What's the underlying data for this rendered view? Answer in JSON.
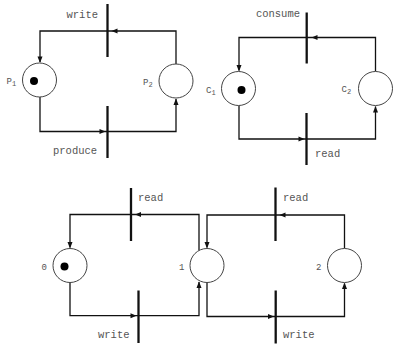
{
  "diagram": {
    "top_left_net": {
      "places": [
        {
          "label": "P",
          "subscript": "1",
          "tokens": 1
        },
        {
          "label": "P",
          "subscript": "2",
          "tokens": 0
        }
      ],
      "transitions": [
        {
          "label": "write",
          "position": "top"
        },
        {
          "label": "produce",
          "position": "bottom"
        }
      ],
      "arcs": [
        {
          "from": "P2",
          "to": "write"
        },
        {
          "from": "write",
          "to": "P1"
        },
        {
          "from": "P1",
          "to": "produce"
        },
        {
          "from": "produce",
          "to": "P2"
        }
      ]
    },
    "top_right_net": {
      "places": [
        {
          "label": "C",
          "subscript": "1",
          "tokens": 1
        },
        {
          "label": "C",
          "subscript": "2",
          "tokens": 0
        }
      ],
      "transitions": [
        {
          "label": "consume",
          "position": "top"
        },
        {
          "label": "read",
          "position": "bottom"
        }
      ],
      "arcs": [
        {
          "from": "C2",
          "to": "consume"
        },
        {
          "from": "consume",
          "to": "C1"
        },
        {
          "from": "C1",
          "to": "read"
        },
        {
          "from": "read",
          "to": "C2"
        }
      ]
    },
    "bottom_net": {
      "places": [
        {
          "label": "0",
          "tokens": 1
        },
        {
          "label": "1",
          "tokens": 0
        },
        {
          "label": "2",
          "tokens": 0
        }
      ],
      "transitions": [
        {
          "label": "read",
          "position": "top-left"
        },
        {
          "label": "write",
          "position": "bottom-left"
        },
        {
          "label": "read",
          "position": "top-right"
        },
        {
          "label": "write",
          "position": "bottom-right"
        }
      ],
      "arcs": [
        {
          "from": "1",
          "to": "read (top-left)"
        },
        {
          "from": "read (top-left)",
          "to": "0"
        },
        {
          "from": "0",
          "to": "write (bottom-left)"
        },
        {
          "from": "write (bottom-left)",
          "to": "1"
        },
        {
          "from": "2",
          "to": "read (top-right)"
        },
        {
          "from": "read (top-right)",
          "to": "1"
        },
        {
          "from": "1",
          "to": "write (bottom-right)"
        },
        {
          "from": "write (bottom-right)",
          "to": "2"
        }
      ]
    }
  },
  "colors": {
    "line": "#111111",
    "place_stroke": "#444444",
    "token": "#000000",
    "text": "#555555",
    "background": "#ffffff"
  }
}
